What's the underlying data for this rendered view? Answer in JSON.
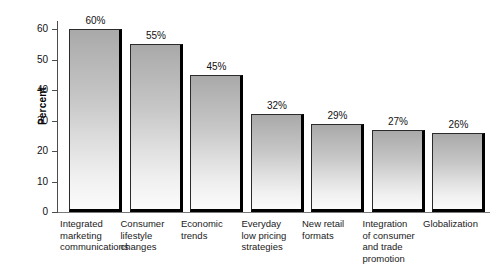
{
  "chart_data": {
    "type": "bar",
    "title": "",
    "subtitle": "",
    "xlabel": "",
    "ylabel": "Percent",
    "ylim": [
      0,
      60
    ],
    "yticks": [
      0,
      10,
      20,
      30,
      40,
      50,
      60
    ],
    "ytick_labels": [
      "0",
      "10",
      "20",
      "30",
      "40",
      "50",
      "60"
    ],
    "grid": false,
    "legend": "none",
    "orientation": "vertical",
    "value_suffix": "%",
    "categories": [
      "Integrated marketing communications",
      "Consumer lifestyle changes",
      "Economic trends",
      "Everyday low pricing strategies",
      "New retail formats",
      "Integration of consumer and trade promotion",
      "Globalization"
    ],
    "values": [
      60,
      55,
      45,
      32,
      29,
      27,
      26
    ],
    "value_labels": [
      "60%",
      "55%",
      "45%",
      "32%",
      "29%",
      "27%",
      "26%"
    ],
    "bars": [
      {
        "category": "Integrated marketing communications",
        "category_lines": [
          "Integrated",
          "marketing",
          "communications"
        ],
        "value": 60,
        "value_label": "60%"
      },
      {
        "category": "Consumer lifestyle changes",
        "category_lines": [
          "Consumer",
          "lifestyle",
          "changes"
        ],
        "value": 55,
        "value_label": "55%"
      },
      {
        "category": "Economic trends",
        "category_lines": [
          "Economic",
          "trends"
        ],
        "value": 45,
        "value_label": "45%"
      },
      {
        "category": "Everyday low pricing strategies",
        "category_lines": [
          "Everyday",
          "low pricing",
          "strategies"
        ],
        "value": 32,
        "value_label": "32%"
      },
      {
        "category": "New retail formats",
        "category_lines": [
          "New retail",
          "formats"
        ],
        "value": 29,
        "value_label": "29%"
      },
      {
        "category": "Integration of consumer and trade promotion",
        "category_lines": [
          "Integration",
          "of consumer",
          "and trade",
          "promotion"
        ],
        "value": 27,
        "value_label": "27%"
      },
      {
        "category": "Globalization",
        "category_lines": [
          "Globalization"
        ],
        "value": 26,
        "value_label": "26%"
      }
    ],
    "colors": {
      "bar_top": "#a9a9a9",
      "bar_bottom": "#fbfbfb",
      "bar_outline": "#2b2b2b",
      "bar_shadow": "#000000",
      "axis": "#4d4d4d",
      "text": "#111111",
      "background": "#ffffff"
    }
  }
}
